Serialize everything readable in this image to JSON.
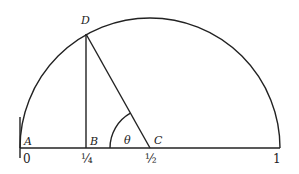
{
  "diagram": {
    "type": "semicircle-geometry",
    "colors": {
      "stroke": "#222222",
      "background": "#ffffff"
    },
    "points": {
      "A": {
        "label": "A"
      },
      "B": {
        "label": "B"
      },
      "C": {
        "label": "C"
      },
      "D": {
        "label": "D"
      }
    },
    "angle_label": "θ",
    "axis_ticks": [
      "0",
      "¼",
      "½",
      "1"
    ]
  }
}
